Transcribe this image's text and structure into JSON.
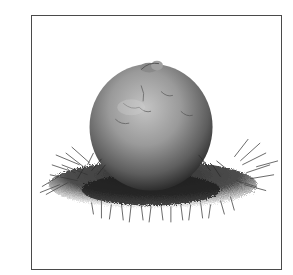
{
  "figure": {
    "style": "grayscale photograph",
    "frame_color": "#4a4a4a",
    "background_color": "#ffffff",
    "top_text_fragment": ""
  }
}
